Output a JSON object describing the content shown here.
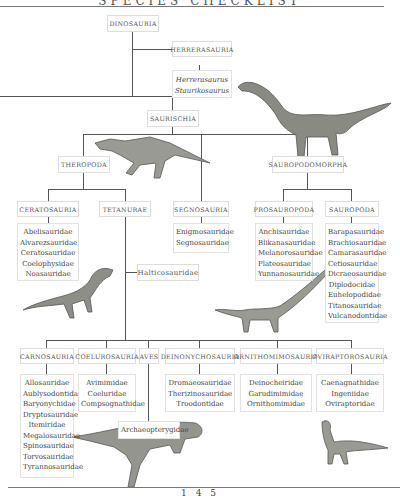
{
  "header": {
    "title": "SPECIES CHECKLIST"
  },
  "page_number": "145",
  "tree": {
    "dinosauria": "Dinosauria",
    "herrerasauria": {
      "label": "Herrerasauria",
      "members": [
        "Herrerasaurus",
        "Staurikosaurus"
      ]
    },
    "saurischia": "Saurischia",
    "theropoda": "Theropoda",
    "sauropodomorpha": "Sauropodomorpha",
    "ceratosauria": {
      "label": "Ceratosauria",
      "members": [
        "Abelisauridae",
        "Alvarezsauridae",
        "Ceratosauridae",
        "Coelophysidae",
        "Noasauridae"
      ]
    },
    "tetanurae": "Tetanurae",
    "halticosauridae": "Halticosauridae",
    "segnosauria": {
      "label": "Segnosauria",
      "members": [
        "Enigmosauridae",
        "Segnosauridae"
      ]
    },
    "prosauropoda": {
      "label": "Prosauropoda",
      "members": [
        "Anchisauridae",
        "Blikanasauridae",
        "Melanorosauridae",
        "Plateosauridae",
        "Yunnanosauridae"
      ]
    },
    "sauropoda": {
      "label": "Sauropoda",
      "members": [
        "Barapasauridae",
        "Brachiosauridae",
        "Camarasauridae",
        "Cetiosauridae",
        "Dicraeosauridae",
        "Diplodocidae",
        "Euhelopodidae",
        "Titanosauridae",
        "Vulcanodontidae"
      ]
    },
    "carnosauria": {
      "label": "Carnosauria",
      "members": [
        "Allosauridae",
        "Aublysodontidae",
        "Baryonychidae",
        "Dryptosauridae",
        "Itemiridae",
        "Megalosauridae",
        "Spinosauridae",
        "Torvosauridae",
        "Tyrannosauridae"
      ]
    },
    "coelurosauria": {
      "label": "Coelurosauria",
      "members": [
        "Avimimidae",
        "Coeluridae",
        "Compsognathidae"
      ]
    },
    "aves": {
      "label": "Aves",
      "members": [
        "Archaeopterygidae"
      ]
    },
    "deinonychosauria": {
      "label": "Deinonychosauria",
      "members": [
        "Dromaeosauridae",
        "Therizinosauridae",
        "Troodontidae"
      ]
    },
    "ornithomimosauria": {
      "label": "Ornithomimosauria",
      "members": [
        "Deinocheiridae",
        "Garudimimidae",
        "Ornithomimidae"
      ]
    },
    "oviraptorosauria": {
      "label": "Oviraptorosauria",
      "members": [
        "Caenagnathidae",
        "Ingeniidae",
        "Oviraptoridae"
      ]
    }
  },
  "illustrations": [
    "sauropod-illustration",
    "theropod-illustration",
    "small-theropod-illustration",
    "prosauropod-illustration",
    "carnosaur-illustration",
    "oviraptorosaur-illustration"
  ]
}
